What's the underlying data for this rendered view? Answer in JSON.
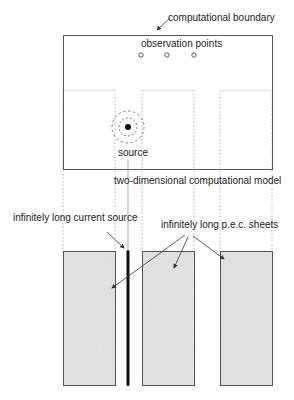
{
  "labels": {
    "boundary": "computational boundary",
    "observation": "observation points",
    "source": "source",
    "model": "two-dimensional computational model",
    "current_source": "infinitely long current source",
    "pec_sheets": "infinitely long p.e.c. sheets"
  },
  "figure": {
    "observation_point_count": 3,
    "pec_sheet_count": 3,
    "colors": {
      "line": "#555555",
      "fill": "#e6e6e6",
      "source": "#111111"
    }
  }
}
